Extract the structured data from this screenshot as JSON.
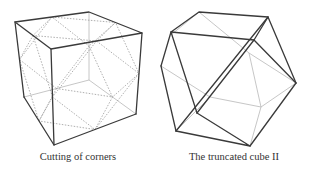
{
  "figures": [
    {
      "id": "cube",
      "caption": "Cutting of corners",
      "description": "Cube with dotted lines marking edge midpoints joined to cut off corners"
    },
    {
      "id": "cuboctahedron",
      "caption": "The truncated cube II",
      "description": "Resulting polyhedron (cuboctahedron) after cutting corners at edge midpoints"
    }
  ],
  "colors": {
    "solid_edge": "#3a3a3a",
    "hidden_edge": "#b8b8b8",
    "dotted_edge": "#9a9a9a",
    "caption_text": "#333333",
    "background": "#ffffff"
  }
}
